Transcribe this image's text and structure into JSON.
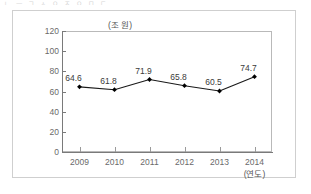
{
  "figure": {
    "top_text_remnant": "ㄴ ㅡ ㄱ ㅅ ㅇ ㅈ ㅇ ㅁ ㄷ",
    "y_unit_label": "(조 원)",
    "x_unit_label": "(연도)"
  },
  "chart_data": {
    "type": "line",
    "title": "",
    "subtitle": "",
    "xlabel": "(연도)",
    "ylabel": "(조 원)",
    "categories": [
      "2009",
      "2010",
      "2011",
      "2012",
      "2013",
      "2014"
    ],
    "values": [
      64.6,
      61.8,
      71.9,
      65.8,
      60.5,
      74.7
    ],
    "point_labels": [
      "64.6",
      "61.8",
      "71.9",
      "65.8",
      "60.5",
      "74.7"
    ],
    "series": [
      {
        "name": "",
        "values": [
          64.6,
          61.8,
          71.9,
          65.8,
          60.5,
          74.7
        ]
      }
    ],
    "ylim": [
      0,
      120
    ],
    "yticks": [
      0,
      20,
      40,
      60,
      80,
      100,
      120
    ],
    "ytick_labels": [
      "0",
      "20",
      "40",
      "60",
      "80",
      "100",
      "120"
    ],
    "grid": false,
    "legend": false,
    "legend_position": "none",
    "marker": "diamond",
    "colors": {
      "line": "#1a1a1a",
      "marker": "#000000",
      "axis": "#7a7a7a",
      "plot_border": "#b9b9b9",
      "figure_border": "#cfcfcf",
      "tick_text": "#6a6a6a",
      "label_text": "#3b3b3b",
      "background": "#ffffff"
    }
  }
}
